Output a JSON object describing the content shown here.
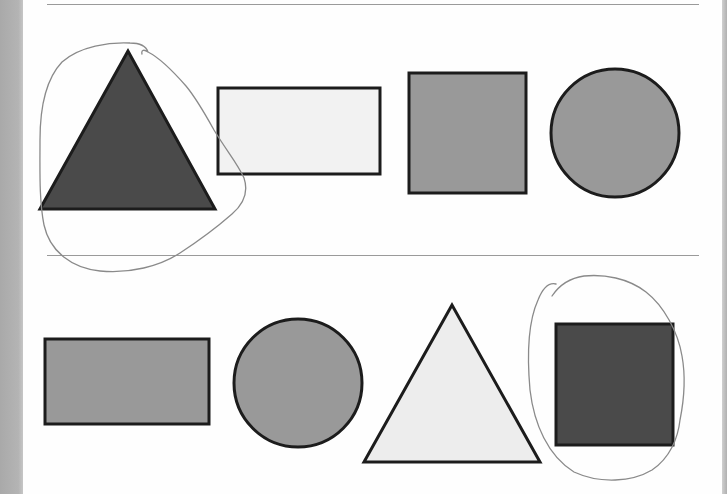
{
  "worksheet": {
    "rows": [
      {
        "id": "row-1",
        "shapes": [
          {
            "kind": "triangle",
            "fill": "#4a4a4a",
            "circled": true
          },
          {
            "kind": "rectangle",
            "fill": "#f2f2f2",
            "circled": false
          },
          {
            "kind": "square",
            "fill": "#999999",
            "circled": false
          },
          {
            "kind": "circle",
            "fill": "#999999",
            "circled": false
          }
        ]
      },
      {
        "id": "row-2",
        "shapes": [
          {
            "kind": "rectangle",
            "fill": "#999999",
            "circled": false
          },
          {
            "kind": "circle",
            "fill": "#999999",
            "circled": false
          },
          {
            "kind": "triangle",
            "fill": "#ededed",
            "circled": false
          },
          {
            "kind": "square",
            "fill": "#4a4a4a",
            "circled": true
          }
        ]
      }
    ],
    "colors": {
      "outline": "#1c1c1c",
      "dark": "#4a4a4a",
      "mid": "#999999",
      "light": "#f2f2f2",
      "rule_line": "#9a9a9a",
      "pencil": "#8a8a8a",
      "page_edge": "#b0b0b0"
    }
  }
}
